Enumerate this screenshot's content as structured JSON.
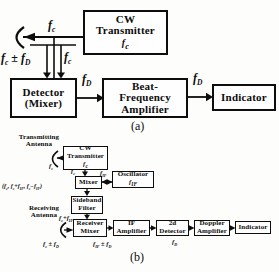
{
  "figure": {
    "caption_a": "(a)",
    "caption_b": "(b)",
    "ink_color": "#0d0d0d",
    "background_color": "#fdfdfb"
  },
  "a": {
    "boxes": {
      "cw_transmitter": {
        "line1": "CW",
        "line2": "Transmitter",
        "freq": [
          [
            "f",
            "i"
          ],
          [
            "c",
            "s"
          ]
        ]
      },
      "detector": {
        "line1": "Detector",
        "line2": "(Mixer)"
      },
      "beat_frequency_amplifier": {
        "line1": "Beat-",
        "line2": "Frequency",
        "line3": "Amplifier"
      },
      "indicator": {
        "line1": "Indicator"
      }
    },
    "labels": {
      "fc_to_antenna": [
        [
          "f",
          "i"
        ],
        [
          "c",
          "s"
        ]
      ],
      "fc_pm_fd": [
        [
          "f",
          "i"
        ],
        [
          "c",
          "s"
        ],
        [
          " ± ",
          ""
        ],
        [
          "f",
          "i"
        ],
        [
          "D",
          "s"
        ]
      ],
      "fc_reference": [
        [
          "f",
          "i"
        ],
        [
          "c",
          "s"
        ]
      ],
      "fd_detector_out": [
        [
          "f",
          "i"
        ],
        [
          "D",
          "s"
        ]
      ],
      "fd_amplifier_out": [
        [
          "f",
          "i"
        ],
        [
          "D",
          "s"
        ]
      ]
    }
  },
  "b": {
    "antennas": {
      "transmitting": {
        "line1": "Transmitting",
        "line2": "Antenna"
      },
      "receiving": {
        "line1": "Receiving",
        "line2": "Antenna"
      }
    },
    "boxes": {
      "cw_transmitter": {
        "line1": "CW",
        "line2": "Transmitter",
        "freq": [
          [
            "f",
            "i"
          ],
          [
            "c",
            "s"
          ]
        ]
      },
      "mixer": {
        "line1": "Mixer"
      },
      "oscillator": {
        "line1": "Oscillator",
        "freq": [
          [
            "f",
            "i"
          ],
          [
            "IF",
            "s"
          ]
        ]
      },
      "sideband_filter": {
        "line1": "Sideband",
        "line2": "Filter"
      },
      "receiver_mixer": {
        "line1": "Receiver",
        "line2": "Mixer"
      },
      "if_amplifier": {
        "line1": "IF",
        "line2": "Amplifier"
      },
      "second_detector": {
        "line1": "2d",
        "line2": "Detector"
      },
      "doppler_amplifier": {
        "line1": "Doppler",
        "line2": "Amplifier"
      },
      "indicator": {
        "line1": "Indicator"
      }
    },
    "labels": {
      "fc_radiated": [
        [
          "f",
          "i"
        ],
        [
          "c",
          "s"
        ]
      ],
      "fc_to_mixer": [
        [
          "f",
          "i"
        ],
        [
          "c",
          "s"
        ]
      ],
      "fif_oscillator": [
        [
          "f",
          "i"
        ],
        [
          "IF",
          "s"
        ]
      ],
      "mixer_output": [
        [
          "(",
          ""
        ],
        [
          "f",
          "i"
        ],
        [
          "c",
          "s"
        ],
        [
          ", ",
          ""
        ],
        [
          "f",
          "i"
        ],
        [
          "c",
          "s"
        ],
        [
          "+",
          ""
        ],
        [
          "f",
          "i"
        ],
        [
          "IF",
          "s"
        ],
        [
          ", ",
          ""
        ],
        [
          "f",
          "i"
        ],
        [
          "c",
          "s"
        ],
        [
          "−",
          ""
        ],
        [
          "f",
          "i"
        ],
        [
          "IF",
          "s"
        ],
        [
          ")",
          ""
        ]
      ],
      "fc_plus_fif": [
        [
          "f",
          "i"
        ],
        [
          "c",
          "s"
        ],
        [
          "+",
          ""
        ],
        [
          "f",
          "i"
        ],
        [
          "IF",
          "s"
        ]
      ],
      "fc_pm_fd": [
        [
          "f",
          "i"
        ],
        [
          "c",
          "s"
        ],
        [
          " ± ",
          ""
        ],
        [
          "f",
          "i"
        ],
        [
          "D",
          "s"
        ]
      ],
      "fif_pm_fd": [
        [
          "f",
          "i"
        ],
        [
          "IF",
          "s"
        ],
        [
          " ± ",
          ""
        ],
        [
          "f",
          "i"
        ],
        [
          "D",
          "s"
        ]
      ],
      "fd_detected": [
        [
          "f",
          "i"
        ],
        [
          "D",
          "s"
        ]
      ]
    }
  }
}
